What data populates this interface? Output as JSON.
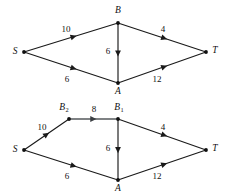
{
  "figure": {
    "kind": "flow-network-diagram",
    "panel_count": 2,
    "colors": {
      "background": "#ffffff",
      "edge": "#1a1a1a",
      "edge_highlight": "#55595c",
      "label": "#111111",
      "vertex": "#101010"
    }
  },
  "top_graph": {
    "name": "network-before-split",
    "nodes": [
      {
        "id": "S",
        "label": "S",
        "sub": "",
        "x": 24,
        "y": 52,
        "label_x": 15,
        "label_y": 52
      },
      {
        "id": "B",
        "label": "B",
        "sub": "",
        "x": 118,
        "y": 23,
        "label_x": 118,
        "label_y": 11
      },
      {
        "id": "A",
        "label": "A",
        "sub": "",
        "x": 118,
        "y": 83,
        "label_x": 118,
        "label_y": 92
      },
      {
        "id": "T",
        "label": "T",
        "sub": "",
        "x": 206,
        "y": 52,
        "label_x": 215,
        "label_y": 51
      }
    ],
    "edges": [
      {
        "id": "S-B",
        "from": "S",
        "to": "B",
        "capacity": "10",
        "label_x": 66,
        "label_y": 30,
        "highlight": false
      },
      {
        "id": "S-A",
        "from": "S",
        "to": "A",
        "capacity": "6",
        "label_x": 67,
        "label_y": 80,
        "highlight": false
      },
      {
        "id": "B-A",
        "from": "B",
        "to": "A",
        "capacity": "6",
        "label_x": 108,
        "label_y": 52,
        "highlight": false
      },
      {
        "id": "B-T",
        "from": "B",
        "to": "T",
        "capacity": "4",
        "label_x": 163,
        "label_y": 30,
        "highlight": false
      },
      {
        "id": "A-T",
        "from": "A",
        "to": "T",
        "capacity": "12",
        "label_x": 157,
        "label_y": 80,
        "highlight": false
      }
    ]
  },
  "bottom_graph": {
    "name": "network-after-node-split",
    "nodes": [
      {
        "id": "S",
        "label": "S",
        "sub": "",
        "x": 24,
        "y": 53,
        "label_x": 15,
        "label_y": 53
      },
      {
        "id": "B2",
        "label": "B",
        "sub": "2",
        "x": 69,
        "y": 22,
        "label_x": 64,
        "label_y": 11
      },
      {
        "id": "B1",
        "label": "B",
        "sub": "1",
        "x": 118,
        "y": 22,
        "label_x": 119,
        "label_y": 11
      },
      {
        "id": "A",
        "label": "A",
        "sub": "",
        "x": 118,
        "y": 83,
        "label_x": 118,
        "label_y": 92
      },
      {
        "id": "T",
        "label": "T",
        "sub": "",
        "x": 206,
        "y": 53,
        "label_x": 215,
        "label_y": 52
      }
    ],
    "edges": [
      {
        "id": "S-B2",
        "from": "S",
        "to": "B2",
        "capacity": "10",
        "label_x": 42,
        "label_y": 31,
        "highlight": false
      },
      {
        "id": "B2-B1",
        "from": "B2",
        "to": "B1",
        "capacity": "8",
        "label_x": 94,
        "label_y": 13,
        "highlight": true
      },
      {
        "id": "S-A",
        "from": "S",
        "to": "A",
        "capacity": "6",
        "label_x": 67,
        "label_y": 80,
        "highlight": false
      },
      {
        "id": "B1-A",
        "from": "B1",
        "to": "A",
        "capacity": "6",
        "label_x": 108,
        "label_y": 52,
        "highlight": false
      },
      {
        "id": "B1-T",
        "from": "B1",
        "to": "T",
        "capacity": "4",
        "label_x": 163,
        "label_y": 31,
        "highlight": false
      },
      {
        "id": "A-T",
        "from": "A",
        "to": "T",
        "capacity": "12",
        "label_x": 157,
        "label_y": 80,
        "highlight": false
      }
    ]
  }
}
